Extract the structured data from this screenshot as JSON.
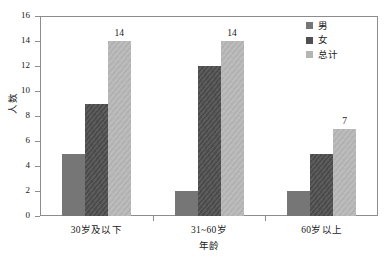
{
  "chart_data": {
    "type": "bar",
    "title": "",
    "subtitle": "",
    "xlabel": "年龄",
    "ylabel": "人数",
    "categories": [
      "30岁及以下",
      "31~60岁",
      "60岁以上"
    ],
    "series": [
      {
        "name": "男",
        "values": [
          5,
          2,
          2
        ],
        "color": "#767676"
      },
      {
        "name": "女",
        "values": [
          9,
          12,
          5
        ],
        "color": "#4f4f4f"
      },
      {
        "name": "总计",
        "values": [
          14,
          14,
          7
        ],
        "color": "#b5b5b5"
      }
    ],
    "value_labels": [
      {
        "series": "总计",
        "category": "30岁及以下",
        "text": "14"
      },
      {
        "series": "总计",
        "category": "31~60岁",
        "text": "14"
      },
      {
        "series": "总计",
        "category": "60岁以上",
        "text": "7"
      }
    ],
    "ylim": [
      0,
      16
    ],
    "yticks": [
      0,
      2,
      4,
      6,
      8,
      10,
      12,
      14,
      16
    ],
    "ytick_labels": [
      "0",
      "2",
      "4",
      "6",
      "8",
      "10",
      "12",
      "14",
      "16"
    ],
    "grid": false,
    "legend_position": "top-right",
    "legend": [
      "男",
      "女",
      "总计"
    ],
    "background_color": "#ffffff",
    "frame_color": "#8d8d8d"
  }
}
